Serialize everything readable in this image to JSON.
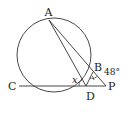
{
  "diagram": {
    "type": "geometry-circle-secant",
    "points": {
      "A": {
        "label": "A",
        "x": 49,
        "y": 20
      },
      "B": {
        "label": "B",
        "x": 93,
        "y": 72
      },
      "C": {
        "label": "C",
        "x": 19,
        "y": 86
      },
      "D": {
        "label": "D",
        "x": 86,
        "y": 86
      },
      "P": {
        "label": "P",
        "x": 106,
        "y": 86
      }
    },
    "circle": {
      "cx": 54,
      "cy": 55,
      "r": 37
    },
    "segments": [
      "A-P",
      "A-D",
      "C-P",
      "B-D"
    ],
    "angles": {
      "given": {
        "label": "48°",
        "vertex": "P"
      },
      "unknown": {
        "label": "x",
        "vertex": "D",
        "between": [
          "A",
          "C"
        ]
      },
      "mark_at_B": {
        "label": "",
        "vertex": "B"
      }
    },
    "colors": {
      "stroke": "#333333",
      "background": "#ffffff"
    }
  }
}
